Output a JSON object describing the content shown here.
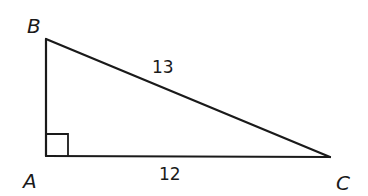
{
  "diagram": {
    "type": "right-triangle",
    "vertices": [
      {
        "id": "A",
        "label": "A",
        "x": 46,
        "y": 156
      },
      {
        "id": "B",
        "label": "B",
        "x": 46,
        "y": 39
      },
      {
        "id": "C",
        "label": "C",
        "x": 330,
        "y": 157
      }
    ],
    "right_angle_at": "A",
    "sides": [
      {
        "from": "B",
        "to": "C",
        "label": "13"
      },
      {
        "from": "A",
        "to": "C",
        "label": "12"
      },
      {
        "from": "A",
        "to": "B",
        "label": ""
      }
    ],
    "labels": {
      "vertex_a": "A",
      "vertex_b": "B",
      "vertex_c": "C",
      "side_bc": "13",
      "side_ac": "12"
    },
    "colors": {
      "stroke": "#1a1a1a",
      "background": "#ffffff"
    }
  }
}
